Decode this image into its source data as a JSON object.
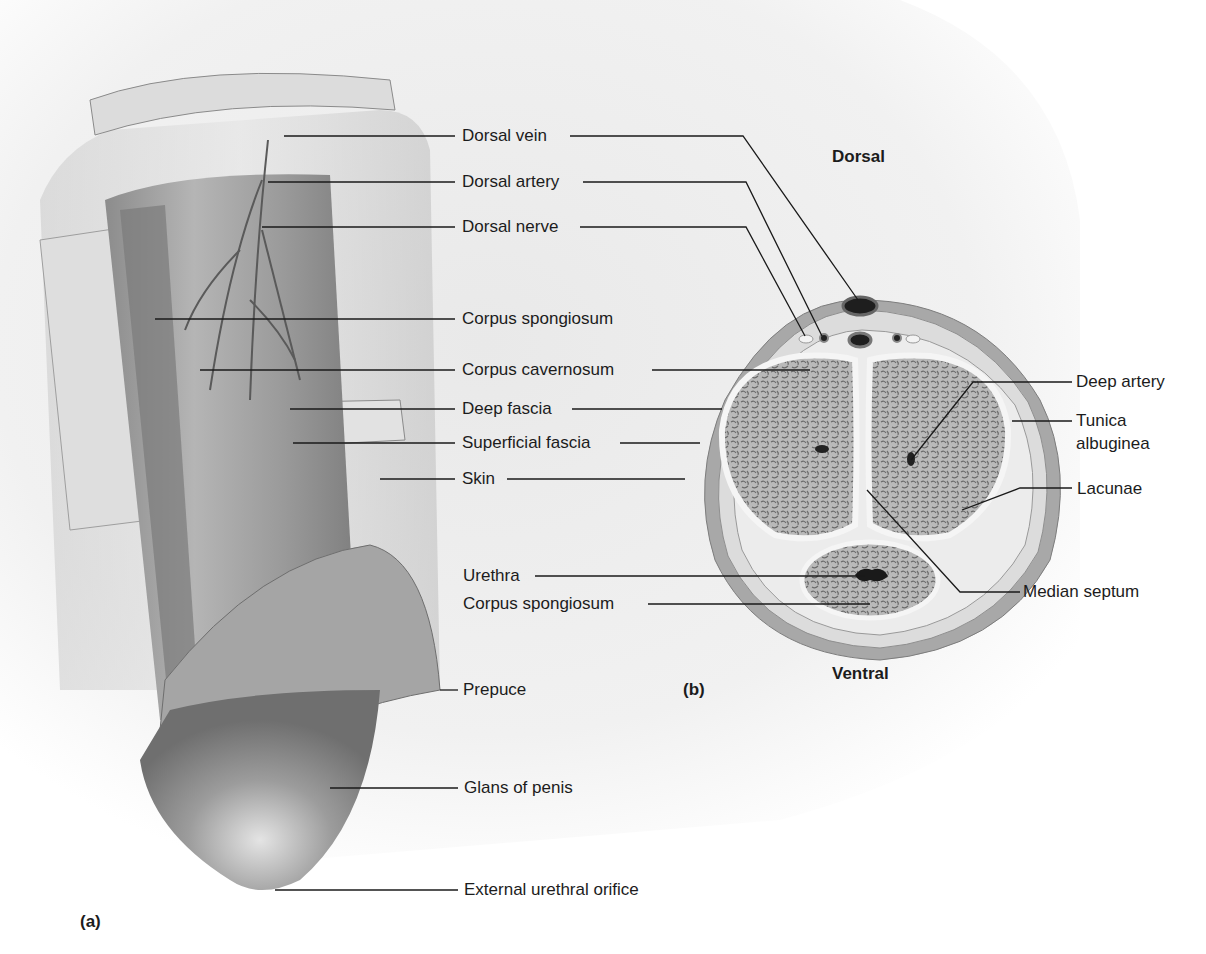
{
  "figure": {
    "panel_a": {
      "tag": "(a)",
      "labels": {
        "dorsal_vein": "Dorsal vein",
        "dorsal_artery": "Dorsal artery",
        "dorsal_nerve": "Dorsal nerve",
        "corpus_spongiosum": "Corpus spongiosum",
        "corpus_cavernosum": "Corpus cavernosum",
        "deep_fascia": "Deep fascia",
        "superficial_fascia": "Superficial fascia",
        "skin": "Skin",
        "prepuce": "Prepuce",
        "glans": "Glans of penis",
        "external_urethral_orifice": "External urethral orifice"
      }
    },
    "panel_b": {
      "tag": "(b)",
      "orientation": {
        "top": "Dorsal",
        "bottom": "Ventral"
      },
      "labels": {
        "urethra": "Urethra",
        "corpus_spongiosum": "Corpus spongiosum",
        "deep_artery": "Deep artery",
        "tunica_line1": "Tunica",
        "tunica_line2": "albuginea",
        "lacunae": "Lacunae",
        "median_septum": "Median septum"
      }
    },
    "colors": {
      "leader_line": "#1a1a1a",
      "tissue_dark": "#7a7a7a",
      "tissue_mid": "#a9a9a9",
      "tissue_light": "#d6d6d6",
      "fascia": "#e8e8e8",
      "background_wash": "#eeeeee"
    }
  }
}
